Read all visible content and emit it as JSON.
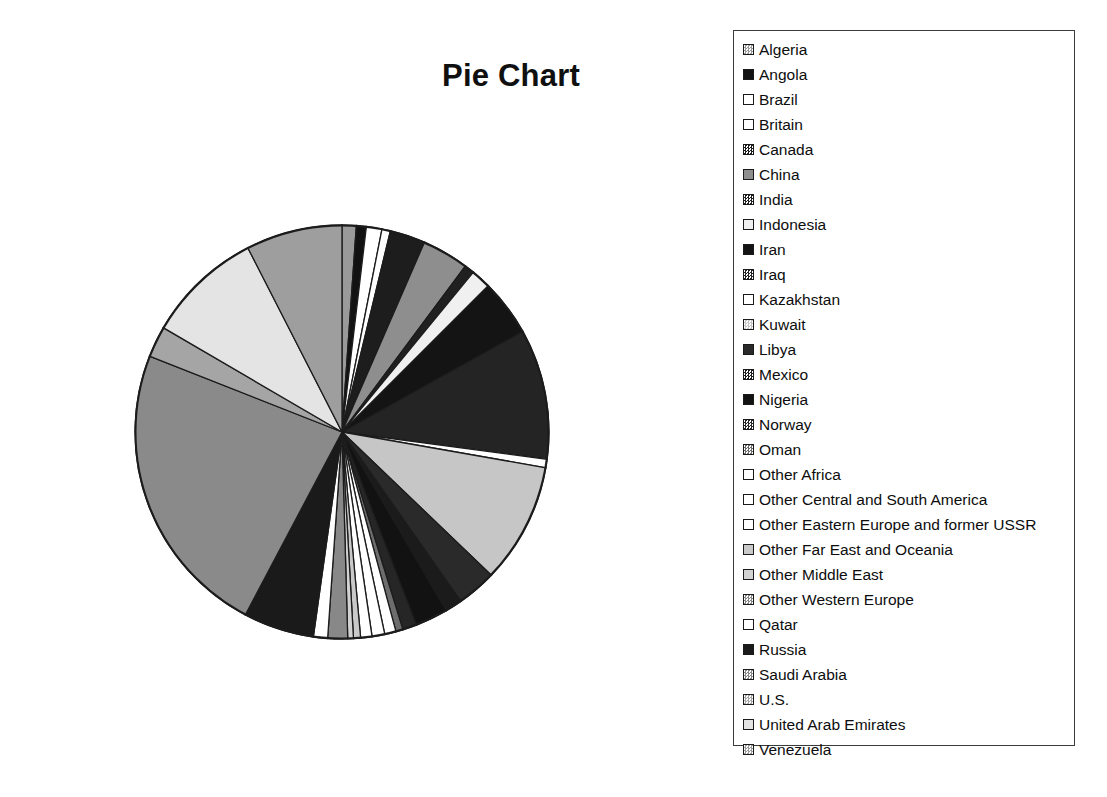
{
  "title": "Pie Chart",
  "legend": {
    "name": "chart-legend",
    "items": [
      {
        "label": "Algeria",
        "swatch": "#9a9a9a",
        "pattern": "checker"
      },
      {
        "label": "Angola",
        "swatch": "#121212",
        "pattern": "solid"
      },
      {
        "label": "Brazil",
        "swatch": "#ffffff",
        "pattern": "solid"
      },
      {
        "label": "Britain",
        "swatch": "#ffffff",
        "pattern": "solid"
      },
      {
        "label": "Canada",
        "swatch": "#1d1d1d",
        "pattern": "checker"
      },
      {
        "label": "China",
        "swatch": "#8e8e8e",
        "pattern": "solid"
      },
      {
        "label": "India",
        "swatch": "#202020",
        "pattern": "checker"
      },
      {
        "label": "Indonesia",
        "swatch": "#f0f0f0",
        "pattern": "solid"
      },
      {
        "label": "Iran",
        "swatch": "#141414",
        "pattern": "solid"
      },
      {
        "label": "Iraq",
        "swatch": "#242424",
        "pattern": "checker"
      },
      {
        "label": "Kazakhstan",
        "swatch": "#ffffff",
        "pattern": "solid"
      },
      {
        "label": "Kuwait",
        "swatch": "#c6c6c6",
        "pattern": "checker"
      },
      {
        "label": "Libya",
        "swatch": "#2a2a2a",
        "pattern": "solid"
      },
      {
        "label": "Mexico",
        "swatch": "#1b1b1b",
        "pattern": "checker"
      },
      {
        "label": "Nigeria",
        "swatch": "#121212",
        "pattern": "solid"
      },
      {
        "label": "Norway",
        "swatch": "#262626",
        "pattern": "checker"
      },
      {
        "label": "Oman",
        "swatch": "#6d6d6d",
        "pattern": "checker"
      },
      {
        "label": "Other Africa",
        "swatch": "#ffffff",
        "pattern": "solid"
      },
      {
        "label": "Other Central and South America",
        "swatch": "#ffffff",
        "pattern": "solid"
      },
      {
        "label": "Other Eastern Europe and former USSR",
        "swatch": "#ffffff",
        "pattern": "solid"
      },
      {
        "label": "Other Far East and Oceania",
        "swatch": "#c9c9c9",
        "pattern": "solid"
      },
      {
        "label": "Other Middle East",
        "swatch": "#d2d2d2",
        "pattern": "solid"
      },
      {
        "label": "Other Western Europe",
        "swatch": "#888888",
        "pattern": "checker"
      },
      {
        "label": "Qatar",
        "swatch": "#ffffff",
        "pattern": "solid"
      },
      {
        "label": "Russia",
        "swatch": "#1a1a1a",
        "pattern": "solid"
      },
      {
        "label": "Saudi Arabia",
        "swatch": "#8a8a8a",
        "pattern": "checker"
      },
      {
        "label": "U.S.",
        "swatch": "#a5a5a5",
        "pattern": "checker"
      },
      {
        "label": "United Arab Emirates",
        "swatch": "#e4e4e4",
        "pattern": "solid"
      },
      {
        "label": "Venezuela",
        "swatch": "#9e9e9e",
        "pattern": "checker"
      }
    ]
  },
  "chart_data": {
    "type": "pie",
    "title": "Pie Chart",
    "xlabel": "",
    "ylabel": "",
    "legend_position": "right",
    "grid": false,
    "start_angle_deg": 0,
    "direction": "clockwise",
    "categories": [
      "Algeria",
      "Angola",
      "Brazil",
      "Britain",
      "Canada",
      "China",
      "India",
      "Indonesia",
      "Iran",
      "Iraq",
      "Kazakhstan",
      "Kuwait",
      "Libya",
      "Mexico",
      "Nigeria",
      "Norway",
      "Oman",
      "Other Africa",
      "Other Central and South America",
      "Other Eastern Europe and former USSR",
      "Other Far East and Oceania",
      "Other Middle East",
      "Other Western Europe",
      "Qatar",
      "Russia",
      "Saudi Arabia",
      "U.S.",
      "United Arab Emirates",
      "Venezuela"
    ],
    "values": [
      1.0,
      0.7,
      1.1,
      0.6,
      2.5,
      3.3,
      0.7,
      1.4,
      4.0,
      9.2,
      0.6,
      8.5,
      2.8,
      1.2,
      2.3,
      1.0,
      0.5,
      0.8,
      0.9,
      0.8,
      0.5,
      0.4,
      1.4,
      1.0,
      5.0,
      21.0,
      2.2,
      8.2,
      6.8
    ],
    "colors": [
      "#9a9a9a",
      "#121212",
      "#ffffff",
      "#ffffff",
      "#1d1d1d",
      "#8e8e8e",
      "#202020",
      "#f0f0f0",
      "#141414",
      "#242424",
      "#ffffff",
      "#c6c6c6",
      "#2a2a2a",
      "#1b1b1b",
      "#121212",
      "#262626",
      "#6d6d6d",
      "#ffffff",
      "#ffffff",
      "#ffffff",
      "#c9c9c9",
      "#d2d2d2",
      "#888888",
      "#ffffff",
      "#1a1a1a",
      "#8a8a8a",
      "#a5a5a5",
      "#e4e4e4",
      "#9e9e9e"
    ],
    "units": "share of total (percent)"
  },
  "pie_geometry": {
    "center_x": 214,
    "center_y": 214,
    "radius": 207
  }
}
